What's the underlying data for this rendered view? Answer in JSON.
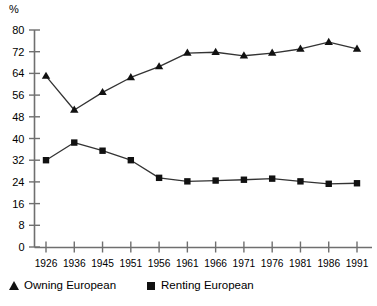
{
  "chart_data": {
    "type": "line",
    "title": "",
    "subtitle": "",
    "xlabel": "",
    "ylabel": "%",
    "unit_label": "%",
    "categories": [
      "1926",
      "1936",
      "1945",
      "1951",
      "1956",
      "1961",
      "1966",
      "1971",
      "1976",
      "1981",
      "1986",
      "1991"
    ],
    "ylim": [
      0,
      80
    ],
    "yticks": [
      0,
      8,
      16,
      24,
      32,
      40,
      48,
      56,
      64,
      72,
      80
    ],
    "ytick_labels": [
      "0",
      "8",
      "16",
      "24",
      "32",
      "40",
      "48",
      "56",
      "64",
      "72",
      "80"
    ],
    "grid": false,
    "legend_position": "bottom-left",
    "series": [
      {
        "name": "Owning European",
        "marker": "triangle",
        "color": "#111111",
        "values": [
          63.0,
          50.5,
          57.0,
          62.5,
          66.5,
          71.5,
          71.8,
          70.5,
          71.5,
          73.0,
          75.5,
          73.0
        ]
      },
      {
        "name": "Renting European",
        "marker": "square",
        "color": "#111111",
        "values": [
          32.0,
          38.5,
          35.5,
          32.0,
          25.5,
          24.2,
          24.5,
          24.8,
          25.2,
          24.2,
          23.3,
          23.5
        ]
      }
    ],
    "annotations": []
  },
  "legend": {
    "entries": [
      {
        "label": "Owning European",
        "marker": "triangle"
      },
      {
        "label": "Renting European",
        "marker": "square"
      }
    ]
  },
  "colors": {
    "axis": "#6f6f6f",
    "line": "#333333",
    "marker": "#111111",
    "text": "#000000",
    "background": "#ffffff"
  }
}
